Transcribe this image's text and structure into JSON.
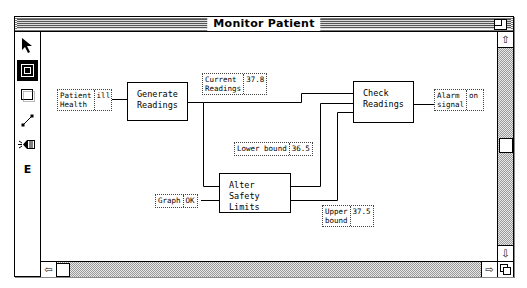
{
  "window": {
    "title": "Monitor Patient"
  },
  "toolbar": {
    "tools": [
      {
        "name": "pointer",
        "icon": "arrow-pointer-icon",
        "selected": false
      },
      {
        "name": "process",
        "icon": "process-box-icon",
        "selected": true
      },
      {
        "name": "store",
        "icon": "store-box-icon",
        "selected": false
      },
      {
        "name": "connector",
        "icon": "connector-line-icon",
        "selected": false
      },
      {
        "name": "alarm",
        "icon": "speaker-icon",
        "selected": false
      },
      {
        "name": "edit",
        "icon": "e-icon",
        "label": "E",
        "selected": false
      }
    ]
  },
  "diagram": {
    "processes": [
      {
        "id": "generate",
        "label": "Generate\nReadings"
      },
      {
        "id": "check",
        "label": "Check\nReadings"
      },
      {
        "id": "alter",
        "label": "Alter Safety\nLimits"
      }
    ],
    "stores": [
      {
        "id": "patient-health",
        "label": "Patient\nHealth",
        "value": "ill"
      },
      {
        "id": "current-readings",
        "label": "Current\nReadings",
        "value": "37.8"
      },
      {
        "id": "alarm-signal",
        "label": "Alarm\nsignal",
        "value": "on"
      },
      {
        "id": "lower-bound",
        "label": "Lower bound",
        "value": "36.5"
      },
      {
        "id": "graph",
        "label": "Graph",
        "value": "OK"
      },
      {
        "id": "upper-bound",
        "label": "Upper\nbound",
        "value": "37.5"
      }
    ]
  },
  "scrollbars": {
    "vertical": {
      "up": "⇧",
      "down": "⇩"
    },
    "horizontal": {
      "left": "⇦",
      "right": "⇨"
    }
  }
}
